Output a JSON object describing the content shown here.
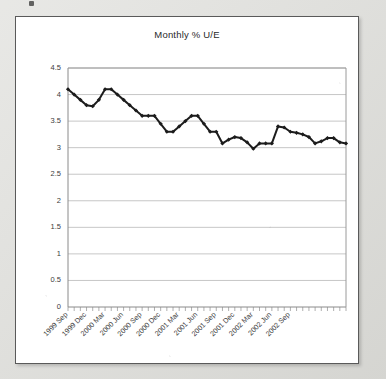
{
  "page": {
    "background_color": "#dcdcd8",
    "card_background": "#ffffff",
    "card_border_color": "#5a5a5a"
  },
  "chart_data": {
    "type": "line",
    "title": "Monthly % U/E",
    "xlabel": "",
    "ylabel": "",
    "ylim": [
      0,
      4.5
    ],
    "ytick_step": 0.5,
    "ytick_labels": [
      "0",
      "0.5",
      "1",
      "1.5",
      "2",
      "2.5",
      "3",
      "3.5",
      "4",
      "4.5"
    ],
    "ytick_values": [
      0,
      0.5,
      1,
      1.5,
      2,
      2.5,
      3,
      3.5,
      4,
      4.5
    ],
    "grid": true,
    "grid_axis": "y",
    "legend": false,
    "legend_position": "none",
    "line_color": "#1c1c1c",
    "marker": "diamond",
    "xtick_labels": [
      "1999 Sep",
      "1999 Dec",
      "2000 Mar",
      "2000 Jun",
      "2000 Sep",
      "2000 Dec",
      "2001 Mar",
      "2001 Jun",
      "2001 Sep",
      "2001 Dec",
      "2002 Mar",
      "2002 Jun",
      "2002 Sep"
    ],
    "xtick_label_interval": 3,
    "xtick_label_rotation": -45,
    "categories": [
      "1999 Sep",
      "1999 Oct",
      "1999 Nov",
      "1999 Dec",
      "2000 Jan",
      "2000 Feb",
      "2000 Mar",
      "2000 Apr",
      "2000 May",
      "2000 Jun",
      "2000 Jul",
      "2000 Aug",
      "2000 Sep",
      "2000 Oct",
      "2000 Nov",
      "2000 Dec",
      "2001 Jan",
      "2001 Feb",
      "2001 Mar",
      "2001 Apr",
      "2001 May",
      "2001 Jun",
      "2001 Jul",
      "2001 Aug",
      "2001 Sep",
      "2001 Oct",
      "2001 Nov",
      "2001 Dec",
      "2002 Jan",
      "2002 Feb",
      "2002 Mar",
      "2002 Apr",
      "2002 May",
      "2002 Jun",
      "2002 Jul",
      "2002 Aug",
      "2002 Sep",
      "2002 Oct"
    ],
    "values": [
      4.1,
      4.0,
      3.9,
      3.8,
      3.78,
      3.9,
      4.1,
      4.1,
      4.0,
      3.9,
      3.8,
      3.7,
      3.6,
      3.6,
      3.6,
      3.45,
      3.3,
      3.3,
      3.4,
      3.5,
      3.6,
      3.6,
      3.45,
      3.3,
      3.3,
      3.08,
      3.15,
      3.2,
      3.18,
      3.1,
      2.98,
      3.08,
      3.08,
      3.08,
      3.4,
      3.38,
      3.3,
      3.28
    ],
    "series": [
      {
        "name": "Monthly % U/E",
        "values": [
          4.1,
          4.0,
          3.9,
          3.8,
          3.78,
          3.9,
          4.1,
          4.1,
          4.0,
          3.9,
          3.8,
          3.7,
          3.6,
          3.6,
          3.6,
          3.45,
          3.3,
          3.3,
          3.4,
          3.5,
          3.6,
          3.6,
          3.45,
          3.3,
          3.3,
          3.08,
          3.15,
          3.2,
          3.18,
          3.1,
          2.98,
          3.08,
          3.08,
          3.08,
          3.4,
          3.38,
          3.3,
          3.28
        ]
      }
    ],
    "extended_values": [
      4.1,
      4.0,
      3.9,
      3.8,
      3.78,
      3.9,
      4.1,
      4.1,
      4.0,
      3.9,
      3.8,
      3.7,
      3.6,
      3.6,
      3.6,
      3.45,
      3.3,
      3.3,
      3.4,
      3.5,
      3.6,
      3.6,
      3.45,
      3.3,
      3.3,
      3.08,
      3.15,
      3.2,
      3.18,
      3.1,
      2.98,
      3.08,
      3.08,
      3.08,
      3.4,
      3.38,
      3.3,
      3.28,
      3.25,
      3.2,
      3.08,
      3.12,
      3.18,
      3.18,
      3.1,
      3.08
    ]
  }
}
